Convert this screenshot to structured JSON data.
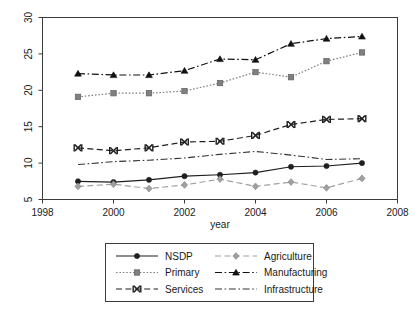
{
  "chart_data": {
    "type": "line",
    "title": "",
    "subtitle": "",
    "xlabel": "year",
    "ylabel": "",
    "x": [
      1999,
      2000,
      2001,
      2002,
      2003,
      2004,
      2005,
      2006,
      2007
    ],
    "xlim": [
      1998,
      2008
    ],
    "ylim": [
      5,
      30
    ],
    "xticks": [
      1998,
      2000,
      2002,
      2004,
      2006,
      2008
    ],
    "yticks": [
      5,
      10,
      15,
      20,
      25,
      30
    ],
    "grid": false,
    "legend_position": "bottom-outside",
    "legend_columns": 2,
    "series": [
      {
        "name": "NSDP",
        "values": [
          7.5,
          7.4,
          7.7,
          8.2,
          8.4,
          8.7,
          9.5,
          9.6,
          10.0
        ],
        "color": "#1f1f1f",
        "marker": "circle",
        "dash": "solid"
      },
      {
        "name": "Primary",
        "values": [
          19.1,
          19.6,
          19.6,
          19.9,
          21.0,
          22.5,
          21.8,
          24.0,
          25.2
        ],
        "color": "#808080",
        "marker": "square",
        "dash": "dotted"
      },
      {
        "name": "Services",
        "values": [
          12.1,
          11.7,
          12.1,
          12.9,
          13.0,
          13.8,
          15.3,
          16.0,
          16.1
        ],
        "color": "#1f1f1f",
        "marker": "x-bar",
        "dash": "dashed"
      },
      {
        "name": "Agriculture",
        "values": [
          6.8,
          7.1,
          6.5,
          7.0,
          7.8,
          6.8,
          7.4,
          6.6,
          7.9
        ],
        "color": "#a0a0a0",
        "marker": "diamond",
        "dash": "dashed"
      },
      {
        "name": "Manufacturing",
        "values": [
          22.3,
          22.1,
          22.1,
          22.7,
          24.3,
          24.2,
          26.4,
          27.1,
          27.4
        ],
        "color": "#111111",
        "marker": "triangle",
        "dash": "dash-dot"
      },
      {
        "name": "Infrastructure",
        "values": [
          9.8,
          10.2,
          10.4,
          10.7,
          11.2,
          11.6,
          11.1,
          10.5,
          10.6
        ],
        "color": "#333333",
        "marker": "none",
        "dash": "dash-dot"
      }
    ]
  },
  "axes": {
    "x_axis_title": "year",
    "x_tick_labels": [
      "1998",
      "2000",
      "2002",
      "2004",
      "2006",
      "2008"
    ],
    "y_tick_labels": [
      "5",
      "10",
      "15",
      "20",
      "25",
      "30"
    ]
  },
  "legend": {
    "entries": [
      {
        "label": "NSDP"
      },
      {
        "label": "Agriculture"
      },
      {
        "label": "Primary"
      },
      {
        "label": "Manufacturing"
      },
      {
        "label": "Services"
      },
      {
        "label": "Infrastructure"
      }
    ]
  }
}
